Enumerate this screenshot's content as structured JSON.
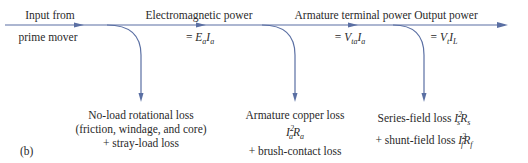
{
  "colors": {
    "flow_line": "#5a6fa3",
    "text": "#2a2a2a"
  },
  "stages": [
    {
      "title_line1": "Input from",
      "title_line2": "prime mover"
    },
    {
      "title": "Electromagnetic power",
      "equation": "= E_a I_a"
    },
    {
      "title": "Armature terminal power",
      "equation": "= V_ta I_a"
    },
    {
      "title": "Output power",
      "equation": "= V_t I_L"
    }
  ],
  "losses": [
    {
      "line1": "No-load rotational loss",
      "line2": "(friction, windage, and core)",
      "line3": "+ stray-load loss"
    },
    {
      "line1": "Armature copper loss",
      "line2": "I_a^2 R_a",
      "line3": "+ brush-contact loss"
    },
    {
      "line1": "Series-field loss I_s^2 R_s",
      "line2": "+ shunt-field loss I_f^2 R_f"
    }
  ],
  "panel_label": "(b)"
}
